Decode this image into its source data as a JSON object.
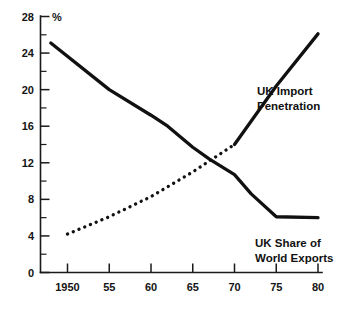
{
  "chart_data": {
    "type": "line",
    "title": "",
    "subtitle": "",
    "xlabel": "",
    "ylabel": "%",
    "unit_label": "%",
    "xlim": [
      1948,
      1981
    ],
    "ylim": [
      0,
      28
    ],
    "grid": false,
    "legend_position": "inline-annotation",
    "x_ticks": [
      {
        "value": 1950,
        "label": "1950"
      },
      {
        "value": 1955,
        "label": "55"
      },
      {
        "value": 1960,
        "label": "60"
      },
      {
        "value": 1965,
        "label": "65"
      },
      {
        "value": 1970,
        "label": "70"
      },
      {
        "value": 1975,
        "label": "75"
      },
      {
        "value": 1980,
        "label": "80"
      }
    ],
    "y_ticks": [
      {
        "value": 0,
        "label": "0"
      },
      {
        "value": 4,
        "label": "4"
      },
      {
        "value": 8,
        "label": "8"
      },
      {
        "value": 12,
        "label": "12"
      },
      {
        "value": 16,
        "label": "16"
      },
      {
        "value": 20,
        "label": "20"
      },
      {
        "value": 24,
        "label": "24"
      },
      {
        "value": 28,
        "label": "28"
      }
    ],
    "y_minor_ticks": [
      2,
      6,
      10,
      14,
      18,
      22,
      26
    ],
    "series": [
      {
        "name": "UK Share of World Exports",
        "style": "solid",
        "color": "#111111",
        "label_text": "UK Share of\nWorld Exports",
        "x": [
          1948,
          1955,
          1960,
          1962,
          1965,
          1967,
          1970,
          1972,
          1975,
          1980
        ],
        "values": [
          25.1,
          20.0,
          17.2,
          16.0,
          13.7,
          12.4,
          10.7,
          8.6,
          6.1,
          6.0
        ]
      },
      {
        "name": "UK Import Penetration",
        "style": "dotted-then-solid",
        "color": "#111111",
        "label_text": "UK Import\nPenetration",
        "dotted_segment": {
          "x": [
            1950,
            1955,
            1960,
            1965,
            1970
          ],
          "values": [
            4.2,
            6.1,
            8.3,
            11.0,
            14.0
          ]
        },
        "solid_segment": {
          "x": [
            1970,
            1975,
            1980
          ],
          "values": [
            14.0,
            20.4,
            26.1
          ]
        }
      }
    ],
    "annotations": [
      {
        "text": "UK Import Penetration",
        "x": 1972,
        "y": 20.5
      },
      {
        "text": "UK Share of World Exports",
        "x": 1974,
        "y": 4.5
      }
    ]
  }
}
